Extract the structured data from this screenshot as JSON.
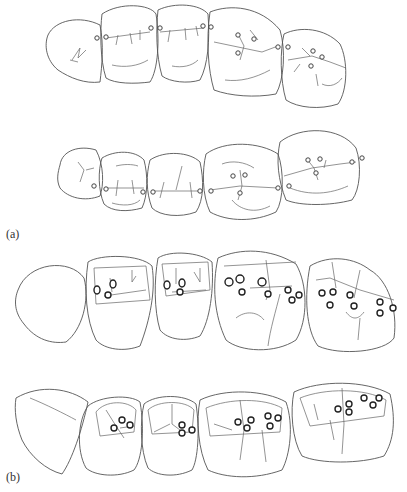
{
  "figure": {
    "panel_labels": {
      "a": "(a)",
      "b": "(b)"
    },
    "panels": [
      {
        "id": "a",
        "rows": [
          {
            "name": "upper-arch-a",
            "teeth": [
              {
                "path": "M48,35 C55,20 80,15 100,25 C104,45 102,65 100,82 C85,84 70,78 58,70 C46,60 44,45 48,35 Z",
                "grooves": [
                  "M72,60 L80,48 L78,58 L86,50 M70,60 L78,62"
                ]
              },
              {
                "path": "M102,14 C120,2 150,4 156,14 C160,40 158,70 150,82 C135,84 115,84 106,78 C100,60 100,30 102,14 Z",
                "grooves": [
                  "M106,38 L150,32 M118,35 L116,45 M130,33 L132,44 M140,30 L140,40 M112,65 C125,68 138,66 148,60"
                ]
              },
              {
                "path": "M158,10 C175,2 200,4 208,14 C210,40 208,65 200,80 C188,84 170,82 162,76 C156,55 156,30 158,10 Z",
                "grooves": [
                  "M160,32 L204,28 M170,30 L168,42 M185,28 L186,40 M196,26 L198,36 M172,66 C182,68 192,66 198,60"
                ]
              },
              {
                "path": "M210,12 C230,4 260,6 280,30 C286,50 284,80 276,94 C255,98 230,96 214,90 C208,70 206,40 210,12 Z",
                "grooves": [
                  "M214,42 L262,52 L278,46 M238,34 L244,46 L240,60 M225,80 C240,82 255,78 270,70 M250,30 L258,40"
                ]
              },
              {
                "path": "M284,34 C300,26 325,28 340,44 C348,60 348,90 338,104 C320,110 298,108 286,100 C280,80 280,50 284,34 Z",
                "grooves": [
                  "M288,60 L312,56 L330,62 L346,68 M302,48 L310,56 M300,64 L294,72 M316,74 L318,86 M322,84 C330,88 338,84 342,78"
                ]
              }
            ],
            "contacts": [
              {
                "cx": 97,
                "cy": 38
              },
              {
                "cx": 106,
                "cy": 37
              },
              {
                "cx": 151,
                "cy": 28
              },
              {
                "cx": 160,
                "cy": 28
              },
              {
                "cx": 203,
                "cy": 26
              },
              {
                "cx": 211,
                "cy": 27
              },
              {
                "cx": 238,
                "cy": 35
              },
              {
                "cx": 254,
                "cy": 39
              },
              {
                "cx": 238,
                "cy": 53
              },
              {
                "cx": 278,
                "cy": 47
              },
              {
                "cx": 288,
                "cy": 47
              },
              {
                "cx": 313,
                "cy": 51
              },
              {
                "cx": 322,
                "cy": 57
              },
              {
                "cx": 311,
                "cy": 66
              }
            ]
          },
          {
            "name": "lower-arch-a",
            "teeth": [
              {
                "path": "M60,165 C62,150 80,145 96,150 C104,165 104,185 100,196 C85,202 68,198 60,188 C56,180 58,172 60,165 Z",
                "grooves": [
                  "M78,162 L84,170 L80,182 M86,170 L94,168"
                ]
              },
              {
                "path": "M102,158 C115,150 135,150 144,160 C148,175 148,195 142,208 C128,212 112,212 104,204 C98,190 98,170 102,158 Z",
                "grooves": [
                  "M106,188 L144,188 M118,180 L116,196 M132,180 L134,194 M112,203 C122,206 134,206 140,200 M116,166 C124,164 132,164 138,166"
                ]
              },
              {
                "path": "M150,160 C165,150 190,152 200,162 C204,180 204,200 196,212 C180,218 160,216 152,208 C146,192 146,175 150,160 Z",
                "grooves": [
                  "M154,191 L198,191 M182,166 L176,190 M164,182 L160,198 M190,182 L192,198"
                ]
              },
              {
                "path": "M206,154 C225,140 260,142 278,154 C284,170 284,200 276,212 C255,222 228,222 210,212 C202,195 202,170 206,154 Z",
                "grooves": [
                  "M210,190 L240,186 L278,188 M240,170 L242,186 L238,200 M232,200 C240,210 255,214 270,206 M222,164 C232,160 245,162 254,168"
                ]
              },
              {
                "path": "M280,142 C300,126 340,126 356,148 C362,165 360,190 352,200 C330,206 300,206 286,200 C278,180 276,160 280,142 Z",
                "grooves": [
                  "M284,176 L312,168 L340,164 L356,162 M306,158 L314,168 L318,180 M326,160 L324,168 M290,188 C310,196 330,194 348,186"
                ]
              }
            ],
            "contacts": [
              {
                "cx": 94,
                "cy": 186
              },
              {
                "cx": 106,
                "cy": 189
              },
              {
                "cx": 143,
                "cy": 192
              },
              {
                "cx": 153,
                "cy": 192
              },
              {
                "cx": 200,
                "cy": 191
              },
              {
                "cx": 211,
                "cy": 191
              },
              {
                "cx": 233,
                "cy": 176
              },
              {
                "cx": 245,
                "cy": 175
              },
              {
                "cx": 240,
                "cy": 193
              },
              {
                "cx": 278,
                "cy": 188
              },
              {
                "cx": 289,
                "cy": 186
              },
              {
                "cx": 308,
                "cy": 160
              },
              {
                "cx": 320,
                "cy": 159
              },
              {
                "cx": 316,
                "cy": 173
              },
              {
                "cx": 352,
                "cy": 162
              },
              {
                "cx": 362,
                "cy": 158
              }
            ]
          }
        ]
      },
      {
        "id": "b",
        "rows": [
          {
            "name": "upper-arch-b",
            "teeth": [
              {
                "path": "M18,290 C28,262 70,258 84,278 C90,300 82,330 66,342 C52,344 36,340 24,324 C14,312 14,300 18,290 Z",
                "grooves": []
              },
              {
                "path": "M88,262 C100,254 140,254 152,266 C156,290 150,320 140,346 C125,352 105,350 96,340 C86,320 84,290 88,262 Z",
                "grooves": [
                  "M94,268 L146,266 L150,300 L96,304 Z",
                  "M110,278 L112,292 M132,270 L132,282 L136,276 M104,296 L146,290"
                ]
              },
              {
                "path": "M158,258 C170,250 200,252 212,262 C214,290 210,320 200,336 C186,342 168,340 160,330 C154,310 154,280 158,258 Z",
                "grooves": [
                  "M162,264 L208,262 L210,290 L166,296 Z",
                  "M176,268 L176,284 M200,268 L200,282 L194,272 M172,292 L206,290"
                ]
              },
              {
                "path": "M218,258 C240,248 270,248 296,264 C308,285 308,320 296,340 C275,354 240,352 226,340 C214,315 212,285 218,258 Z",
                "grooves": [
                  "M224,266 L296,262 M266,260 L270,290 L266,300 M250,288 L292,286 M236,318 C246,310 258,312 264,320 M280,294 C276,310 270,330 268,346"
                ]
              },
              {
                "path": "M310,266 C330,254 355,258 370,270 C388,280 398,310 394,338 C385,352 340,356 318,346 C306,330 304,296 310,266 Z",
                "grooves": [
                  "M316,280 L330,278 L360,290 L394,300 M332,262 L336,288 M360,270 L354,298 M346,312 C352,320 358,320 364,312 M360,318 L358,340"
                ]
              }
            ],
            "contacts_b": [
              {
                "cx": 97,
                "cy": 290,
                "rx": 3,
                "ry": 4
              },
              {
                "cx": 113,
                "cy": 284,
                "rx": 3,
                "ry": 4
              },
              {
                "cx": 108,
                "cy": 295,
                "rx": 3,
                "ry": 3
              },
              {
                "cx": 167,
                "cy": 285,
                "rx": 3,
                "ry": 4
              },
              {
                "cx": 182,
                "cy": 283,
                "rx": 3,
                "ry": 4
              },
              {
                "cx": 180,
                "cy": 292,
                "rx": 3,
                "ry": 3
              },
              {
                "cx": 229,
                "cy": 282,
                "rx": 4,
                "ry": 4
              },
              {
                "cx": 240,
                "cy": 279,
                "rx": 4,
                "ry": 4
              },
              {
                "cx": 242,
                "cy": 292,
                "rx": 3,
                "ry": 3
              },
              {
                "cx": 262,
                "cy": 282,
                "rx": 4,
                "ry": 4
              },
              {
                "cx": 268,
                "cy": 294,
                "rx": 3,
                "ry": 3
              },
              {
                "cx": 288,
                "cy": 290,
                "rx": 3,
                "ry": 3
              },
              {
                "cx": 299,
                "cy": 295,
                "rx": 3,
                "ry": 3
              },
              {
                "cx": 292,
                "cy": 300,
                "rx": 3,
                "ry": 3
              },
              {
                "cx": 322,
                "cy": 293,
                "rx": 3,
                "ry": 3
              },
              {
                "cx": 333,
                "cy": 292,
                "rx": 3,
                "ry": 3
              },
              {
                "cx": 350,
                "cy": 295,
                "rx": 3,
                "ry": 3
              },
              {
                "cx": 330,
                "cy": 305,
                "rx": 3,
                "ry": 3
              },
              {
                "cx": 354,
                "cy": 306,
                "rx": 3,
                "ry": 3
              },
              {
                "cx": 380,
                "cy": 302,
                "rx": 3,
                "ry": 3
              },
              {
                "cx": 393,
                "cy": 308,
                "rx": 3,
                "ry": 3
              },
              {
                "cx": 380,
                "cy": 313,
                "rx": 3,
                "ry": 3
              }
            ]
          },
          {
            "name": "lower-arch-b",
            "teeth": [
              {
                "path": "M16,398 C40,384 70,388 88,402 C82,430 72,460 62,474 C46,470 30,456 22,440 C16,425 14,410 16,398 Z",
                "grooves": [
                  "M30,398 C45,404 65,414 76,420"
                ]
              },
              {
                "path": "M88,406 C100,396 130,394 140,402 C145,430 142,460 134,470 C118,478 95,476 86,468 C76,450 78,420 88,406 Z",
                "grooves": [
                  "M96,412 C105,400 128,400 136,410 L134,432 L100,436 Z",
                  "M106,410 L116,426 L124,438 M120,428 L134,426"
                ]
              },
              {
                "path": "M144,404 C156,394 185,394 196,404 C200,430 198,460 192,470 C176,478 156,476 148,468 C140,450 140,420 144,404 Z",
                "grooves": [
                  "M148,410 C158,400 186,400 194,410 L192,432 L152,434 Z",
                  "M172,404 L172,424 L180,430 M154,432 L170,424"
                ]
              },
              {
                "path": "M200,400 C225,388 265,390 286,402 C294,425 290,455 282,470 C255,480 225,478 208,470 C198,450 196,420 200,400 Z",
                "grooves": [
                  "M206,408 C230,398 264,398 282,408 L280,432 L210,436 Z",
                  "M240,400 L244,430 L240,460 M262,430 L266,462 M214,424 L232,430"
                ]
              },
              {
                "path": "M294,392 C320,380 365,380 390,394 C396,420 394,440 384,456 C360,464 320,464 302,456 C292,440 290,410 294,392 Z",
                "grooves": [
                  "M300,398 C325,388 365,388 386,400 L384,416 L310,426 Z",
                  "M342,388 L344,424 L342,454 M314,404 L318,420 M330,420 L334,440"
                ]
              }
            ],
            "contacts_b": [
              {
                "cx": 114,
                "cy": 428,
                "rx": 3,
                "ry": 3
              },
              {
                "cx": 122,
                "cy": 420,
                "rx": 3,
                "ry": 3
              },
              {
                "cx": 130,
                "cy": 425,
                "rx": 3,
                "ry": 3
              },
              {
                "cx": 182,
                "cy": 425,
                "rx": 3,
                "ry": 3
              },
              {
                "cx": 182,
                "cy": 433,
                "rx": 3,
                "ry": 3
              },
              {
                "cx": 192,
                "cy": 430,
                "rx": 3,
                "ry": 3
              },
              {
                "cx": 238,
                "cy": 422,
                "rx": 3,
                "ry": 3
              },
              {
                "cx": 251,
                "cy": 420,
                "rx": 3,
                "ry": 3
              },
              {
                "cx": 247,
                "cy": 428,
                "rx": 3,
                "ry": 3
              },
              {
                "cx": 268,
                "cy": 416,
                "rx": 3,
                "ry": 3
              },
              {
                "cx": 278,
                "cy": 418,
                "rx": 3,
                "ry": 3
              },
              {
                "cx": 270,
                "cy": 426,
                "rx": 3,
                "ry": 3
              },
              {
                "cx": 338,
                "cy": 409,
                "rx": 3,
                "ry": 3
              },
              {
                "cx": 349,
                "cy": 404,
                "rx": 3,
                "ry": 3
              },
              {
                "cx": 349,
                "cy": 412,
                "rx": 3,
                "ry": 3
              },
              {
                "cx": 364,
                "cy": 398,
                "rx": 3,
                "ry": 3
              },
              {
                "cx": 373,
                "cy": 405,
                "rx": 3,
                "ry": 3
              },
              {
                "cx": 379,
                "cy": 398,
                "rx": 3,
                "ry": 3
              }
            ]
          }
        ]
      }
    ]
  }
}
